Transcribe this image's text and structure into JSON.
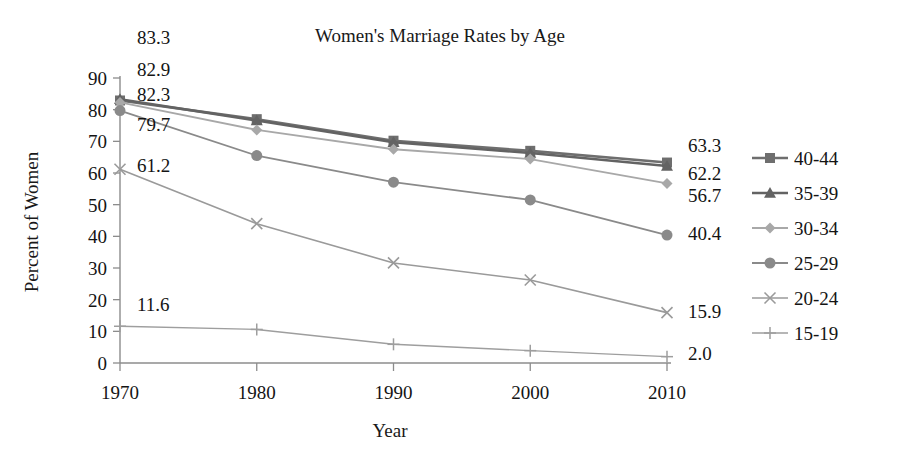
{
  "chart_data": {
    "type": "line",
    "title": "Women's Marriage Rates by Age",
    "xlabel": "Year",
    "ylabel": "Percent of Women",
    "x": [
      1970,
      1980,
      1990,
      2000,
      2010
    ],
    "xtick_labels": [
      "1970",
      "1980",
      "1990",
      "2000",
      "2010"
    ],
    "ytick_labels": [
      "0",
      "10",
      "20",
      "30",
      "40",
      "50",
      "60",
      "70",
      "80",
      "90"
    ],
    "ylim": [
      0,
      90
    ],
    "ytick_step": 10,
    "grid": false,
    "legend_position": "right",
    "series": [
      {
        "name": "40-44",
        "marker": "square",
        "color": "#6e6e6e",
        "line_width": 2.6,
        "values": [
          82.9,
          77.0,
          70.2,
          67.0,
          63.3
        ],
        "start_label": "82.9",
        "end_label": "63.3"
      },
      {
        "name": "35-39",
        "marker": "triangle",
        "color": "#636363",
        "line_width": 2.6,
        "values": [
          83.3,
          76.6,
          69.7,
          66.3,
          62.2
        ],
        "start_label": "83.3",
        "end_label": "62.2"
      },
      {
        "name": "30-34",
        "marker": "diamond",
        "color": "#a8a8a8",
        "line_width": 1.8,
        "values": [
          82.3,
          73.6,
          67.5,
          64.4,
          56.7
        ],
        "start_label": "82.3",
        "end_label": "56.7"
      },
      {
        "name": "25-29",
        "marker": "circle",
        "color": "#8a8a8a",
        "line_width": 1.8,
        "values": [
          79.7,
          65.5,
          57.1,
          51.5,
          40.4
        ],
        "start_label": "79.7",
        "end_label": "40.4"
      },
      {
        "name": "20-24",
        "marker": "x",
        "color": "#9a9a9a",
        "line_width": 1.6,
        "values": [
          61.2,
          44.0,
          31.6,
          26.2,
          15.9
        ],
        "start_label": "61.2",
        "end_label": "15.9"
      },
      {
        "name": "15-19",
        "marker": "plus",
        "color": "#9e9e9e",
        "line_width": 1.4,
        "values": [
          11.6,
          10.6,
          5.9,
          3.9,
          2.0
        ],
        "start_label": "11.6",
        "end_label": "2.0"
      }
    ]
  },
  "legend": {
    "items": [
      {
        "label": "40-44"
      },
      {
        "label": "35-39"
      },
      {
        "label": "30-34"
      },
      {
        "label": "25-29"
      },
      {
        "label": "20-24"
      },
      {
        "label": "15-19"
      }
    ]
  },
  "left_labels": [
    "83.3",
    "82.9",
    "82.3",
    "79.7",
    "61.2",
    "11.6"
  ],
  "right_labels": [
    "63.3",
    "62.2",
    "56.7",
    "40.4",
    "15.9",
    "2.0"
  ]
}
